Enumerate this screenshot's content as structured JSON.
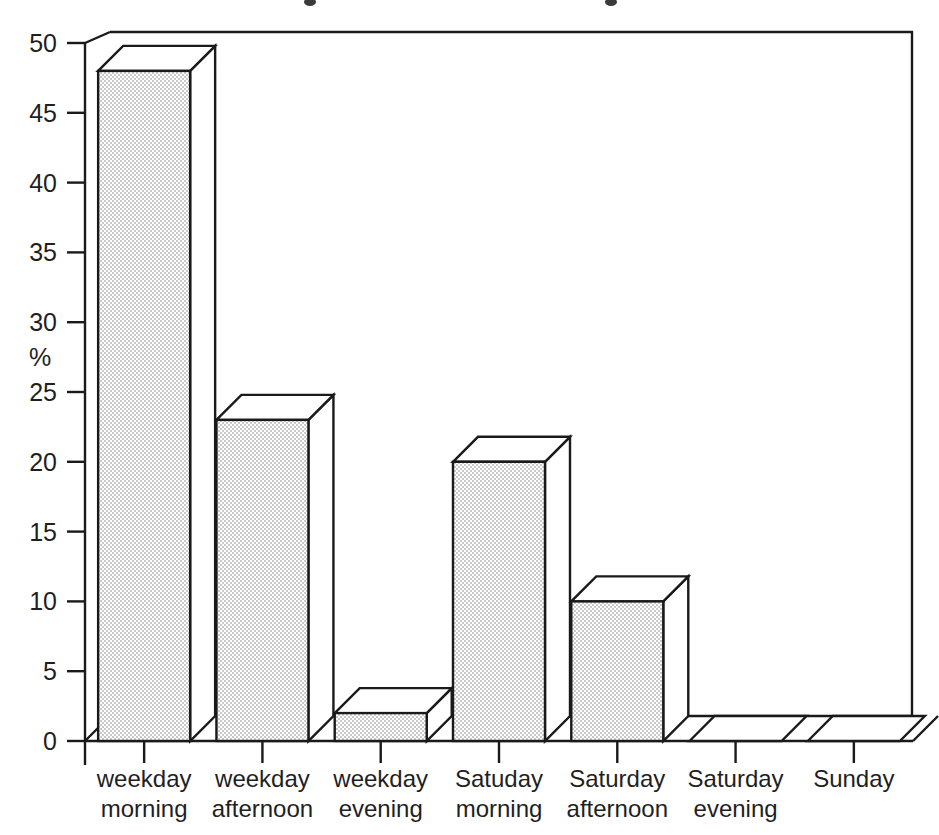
{
  "chart_data": {
    "type": "bar",
    "title": "",
    "xlabel": "",
    "ylabel": "%",
    "ylim": [
      0,
      50
    ],
    "yticks": [
      0,
      5,
      10,
      15,
      20,
      25,
      30,
      35,
      40,
      45,
      50
    ],
    "ytick_labels": [
      "0",
      "5",
      "10",
      "15",
      "20",
      "25",
      "30",
      "35",
      "40",
      "45",
      "50"
    ],
    "grid": false,
    "legend": null,
    "style": "3d-bar",
    "categories": [
      "weekday morning",
      "weekday afternoon",
      "weekday evening",
      "Satuday morning",
      "Saturday afternoon",
      "Saturday evening",
      "Sunday"
    ],
    "category_lines": [
      [
        "weekday",
        "morning"
      ],
      [
        "weekday",
        "afternoon"
      ],
      [
        "weekday",
        "evening"
      ],
      [
        "Satuday",
        "morning"
      ],
      [
        "Saturday",
        "afternoon"
      ],
      [
        "Saturday",
        "evening"
      ],
      [
        "Sunday",
        ""
      ]
    ],
    "values": [
      48,
      23,
      2,
      20,
      10,
      0,
      0
    ],
    "colors": {
      "bar_fill": "#e6e6e6",
      "bar_top_fill": "#ffffff",
      "bar_side_fill": "#ffffff",
      "outline": "#1a1a1a",
      "background": "#ffffff",
      "text": "#1f1f1f"
    }
  },
  "axis": {
    "y_title": "%"
  }
}
